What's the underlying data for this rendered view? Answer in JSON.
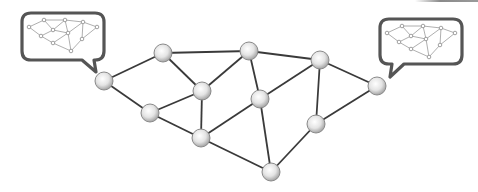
{
  "diagram": {
    "title": "",
    "colors": {
      "edge": "#3a3a3a",
      "node_fill_center": "#ffffff",
      "node_fill_edge": "#a8a8a8",
      "node_stroke": "#8a8a8a",
      "bubble_stroke": "#555555",
      "mini_edge": "#9a9a9a",
      "mini_node_stroke": "#8a8a8a"
    },
    "nodes": [
      {
        "id": "A",
        "x": 104,
        "y": 81
      },
      {
        "id": "B",
        "x": 163,
        "y": 53
      },
      {
        "id": "C",
        "x": 202,
        "y": 91
      },
      {
        "id": "D",
        "x": 150,
        "y": 113
      },
      {
        "id": "E",
        "x": 249,
        "y": 51
      },
      {
        "id": "F",
        "x": 260,
        "y": 99
      },
      {
        "id": "G",
        "x": 201,
        "y": 138
      },
      {
        "id": "H",
        "x": 271,
        "y": 172
      },
      {
        "id": "I",
        "x": 316,
        "y": 124
      },
      {
        "id": "J",
        "x": 320,
        "y": 60
      },
      {
        "id": "K",
        "x": 377,
        "y": 86
      }
    ],
    "edges": [
      [
        "A",
        "B"
      ],
      [
        "A",
        "D"
      ],
      [
        "B",
        "C"
      ],
      [
        "B",
        "E"
      ],
      [
        "C",
        "D"
      ],
      [
        "C",
        "E"
      ],
      [
        "C",
        "G"
      ],
      [
        "D",
        "G"
      ],
      [
        "E",
        "J"
      ],
      [
        "E",
        "F"
      ],
      [
        "F",
        "J"
      ],
      [
        "F",
        "G"
      ],
      [
        "F",
        "H"
      ],
      [
        "G",
        "H"
      ],
      [
        "H",
        "I"
      ],
      [
        "I",
        "J"
      ],
      [
        "J",
        "K"
      ],
      [
        "I",
        "K"
      ]
    ],
    "bubbles": [
      {
        "id": "left-bubble",
        "attached_to": "A",
        "x": 22,
        "y": 13,
        "w": 82,
        "h": 47,
        "tail": "bottom-right"
      },
      {
        "id": "right-bubble",
        "attached_to": "K",
        "x": 380,
        "y": 19,
        "w": 82,
        "h": 45,
        "tail": "bottom-left"
      }
    ],
    "mini_network": {
      "nodes": [
        [
          29,
          27
        ],
        [
          44,
          20
        ],
        [
          53,
          30
        ],
        [
          65,
          20
        ],
        [
          83,
          22
        ],
        [
          97,
          27
        ],
        [
          41,
          36
        ],
        [
          68,
          33
        ],
        [
          53,
          43
        ],
        [
          82,
          39
        ],
        [
          71,
          51
        ]
      ],
      "edges": [
        [
          0,
          1
        ],
        [
          1,
          3
        ],
        [
          3,
          4
        ],
        [
          4,
          5
        ],
        [
          0,
          6
        ],
        [
          1,
          2
        ],
        [
          2,
          3
        ],
        [
          2,
          6
        ],
        [
          2,
          7
        ],
        [
          3,
          7
        ],
        [
          7,
          4
        ],
        [
          4,
          9
        ],
        [
          5,
          9
        ],
        [
          6,
          8
        ],
        [
          8,
          7
        ],
        [
          7,
          10
        ],
        [
          8,
          10
        ],
        [
          9,
          10
        ]
      ]
    }
  }
}
